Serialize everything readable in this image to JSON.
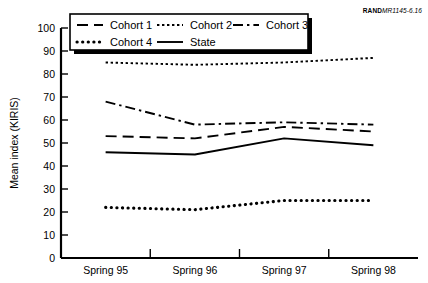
{
  "figure": {
    "source_tag_brand": "RAND",
    "source_tag_code": "MR1145-6.16"
  },
  "legend": {
    "entries": [
      {
        "label": "Cohort 1",
        "style": "dashed"
      },
      {
        "label": "Cohort 2",
        "style": "fine-dotted"
      },
      {
        "label": "Cohort 3",
        "style": "dash-dot"
      },
      {
        "label": "Cohort 4",
        "style": "thick-dotted"
      },
      {
        "label": "State",
        "style": "solid"
      }
    ]
  },
  "chart_data": {
    "type": "line",
    "title": "",
    "xlabel": "",
    "ylabel": "Mean index (KIRIS)",
    "categories": [
      "Spring 95",
      "Spring 96",
      "Spring 97",
      "Spring 98"
    ],
    "ylim": [
      0,
      100
    ],
    "yticks": [
      0,
      10,
      20,
      30,
      40,
      50,
      60,
      70,
      80,
      90,
      100
    ],
    "grid": false,
    "legend_position": "top-inside",
    "series": [
      {
        "name": "Cohort 1",
        "style": "dashed",
        "values": [
          53,
          52,
          57,
          55
        ]
      },
      {
        "name": "Cohort 2",
        "style": "fine-dotted",
        "values": [
          85,
          84,
          85,
          87
        ]
      },
      {
        "name": "Cohort 3",
        "style": "dash-dot",
        "values": [
          68,
          58,
          59,
          58
        ]
      },
      {
        "name": "Cohort 4",
        "style": "thick-dotted",
        "values": [
          22,
          21,
          25,
          25
        ]
      },
      {
        "name": "State",
        "style": "solid",
        "values": [
          46,
          45,
          52,
          49
        ]
      }
    ]
  }
}
